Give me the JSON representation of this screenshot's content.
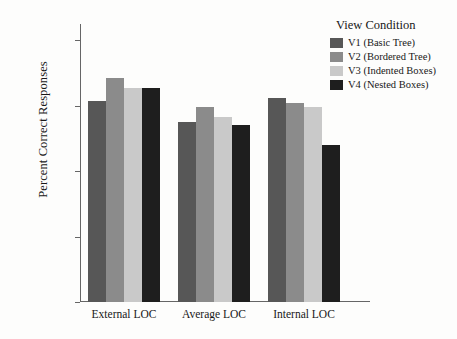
{
  "chart_data": {
    "type": "bar",
    "title": "",
    "xlabel": "",
    "ylabel": "Percent Correct Responses",
    "categories": [
      "External LOC",
      "Average LOC",
      "Internal LOC"
    ],
    "ylim": [
      0,
      85
    ],
    "yticks": [
      0,
      20,
      40,
      60,
      80
    ],
    "yticklabels": [
      "0%",
      "20%",
      "40%",
      "60%",
      "80%"
    ],
    "grid": false,
    "legend_position": "top-right",
    "legend_title": "View Condition",
    "series": [
      {
        "name": "V1 (Basic Tree)",
        "color": "#575757",
        "values": [
          61.5,
          55.0,
          62.5
        ]
      },
      {
        "name": "V2 (Bordered Tree)",
        "color": "#8b8b8b",
        "values": [
          68.5,
          59.5,
          61.0
        ]
      },
      {
        "name": "V3 (Indented Boxes)",
        "color": "#c9c9c9",
        "values": [
          65.5,
          56.5,
          59.5
        ]
      },
      {
        "name": "V4 (Nested Boxes)",
        "color": "#1e1e1e",
        "values": [
          65.5,
          54.0,
          48.0
        ]
      }
    ]
  },
  "figure": {
    "background": "#fdfdfc",
    "axis_color": "#666666"
  }
}
